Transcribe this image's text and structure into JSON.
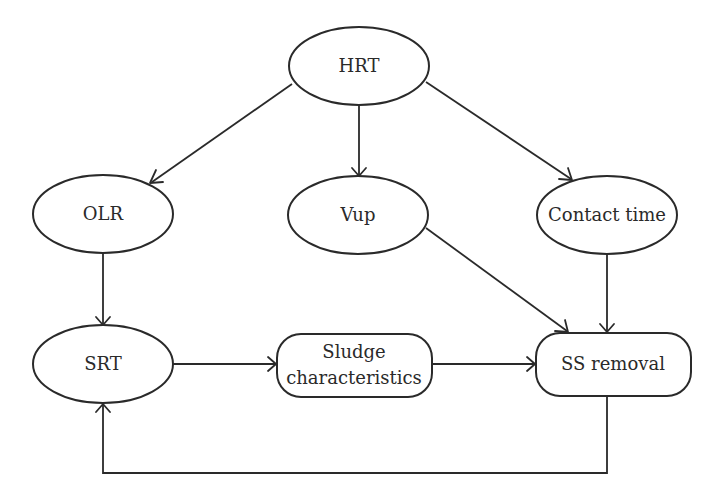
{
  "diagram": {
    "nodes": [
      {
        "id": "hrt",
        "label": "HRT",
        "shape": "ellipse"
      },
      {
        "id": "olr",
        "label": "OLR",
        "shape": "ellipse"
      },
      {
        "id": "vup",
        "label": "Vup",
        "shape": "ellipse"
      },
      {
        "id": "contact_time",
        "label": "Contact time",
        "shape": "ellipse"
      },
      {
        "id": "srt",
        "label": "SRT",
        "shape": "ellipse"
      },
      {
        "id": "sludge",
        "label_line1": "Sludge",
        "label_line2": "characteristics",
        "shape": "rounded-rect"
      },
      {
        "id": "ss_removal",
        "label": "SS removal",
        "shape": "rounded-rect"
      }
    ],
    "edges": [
      {
        "from": "HRT",
        "to": "OLR"
      },
      {
        "from": "HRT",
        "to": "Vup"
      },
      {
        "from": "HRT",
        "to": "Contact time"
      },
      {
        "from": "OLR",
        "to": "SRT"
      },
      {
        "from": "Vup",
        "to": "SS removal"
      },
      {
        "from": "Contact time",
        "to": "SS removal"
      },
      {
        "from": "SRT",
        "to": "Sludge characteristics"
      },
      {
        "from": "Sludge characteristics",
        "to": "SS removal"
      },
      {
        "from": "SS removal",
        "to": "SRT",
        "type": "feedback-loop"
      }
    ],
    "colors": {
      "stroke": "#2a2a2a",
      "background": "#ffffff"
    }
  }
}
